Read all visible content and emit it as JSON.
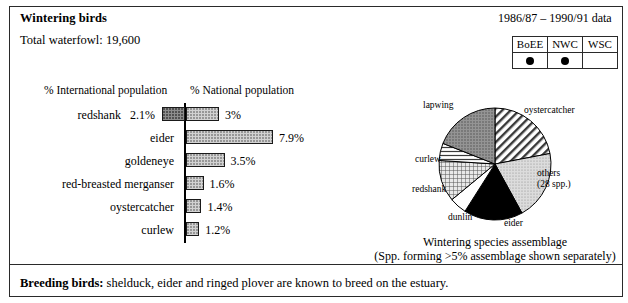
{
  "header": {
    "title": "Wintering birds",
    "total_waterfowl": "Total waterfowl: 19,600",
    "data_period": "1986/87 – 1990/91 data"
  },
  "scheme_table": {
    "columns": [
      "BoEE",
      "NWC",
      "WSC"
    ],
    "marks": [
      "●",
      "●",
      ""
    ]
  },
  "bar_chart": {
    "left_header": "% International population",
    "right_header": "% National population"
  },
  "chart_data": {
    "type": "bar",
    "orientation": "horizontal-diverging",
    "xlabel": "",
    "ylabel": "",
    "categories": [
      "redshank",
      "eider",
      "goldeneye",
      "red-breasted merganser",
      "oystercatcher",
      "curlew"
    ],
    "series": [
      {
        "name": "% International population",
        "side": "left",
        "values": [
          2.1,
          null,
          null,
          null,
          null,
          null
        ],
        "labels": [
          "2.1%",
          "",
          "",
          "",
          "",
          ""
        ]
      },
      {
        "name": "% National population",
        "side": "right",
        "values": [
          3.0,
          7.9,
          3.5,
          1.6,
          1.4,
          1.2
        ],
        "labels": [
          "3%",
          "7.9%",
          "3.5%",
          "1.6%",
          "1.4%",
          "1.2%"
        ]
      }
    ],
    "xlim": [
      0,
      8.5
    ],
    "grid": false,
    "legend": "none"
  },
  "pie_chart": {
    "type": "pie",
    "title": "Wintering species assemblage",
    "caption_line1": "Wintering species assemblage",
    "caption_line2": "(Spp. forming >5% assemblage shown separately)",
    "slices": [
      {
        "label": "oystercatcher",
        "percent": 22,
        "fill": "diagonal-hatch"
      },
      {
        "label": "others\n(28 spp.)",
        "percent": 20,
        "fill": "light-dots"
      },
      {
        "label": "eider",
        "percent": 17,
        "fill": "solid-black"
      },
      {
        "label": "dunlin",
        "percent": 5,
        "fill": "white"
      },
      {
        "label": "redshank",
        "percent": 12,
        "fill": "grid-hatch"
      },
      {
        "label": "curlew",
        "percent": 5,
        "fill": "horizontal-lines"
      },
      {
        "label": "lapwing",
        "percent": 19,
        "fill": "dark-dots"
      }
    ],
    "labels": {
      "oystercatcher": "oystercatcher",
      "others_l1": "others",
      "others_l2": "(28 spp.)",
      "eider": "eider",
      "dunlin": "dunlin",
      "redshank": "redshank",
      "curlew": "curlew",
      "lapwing": "lapwing"
    }
  },
  "footer": {
    "label": "Breeding birds:",
    "text": " shelduck, eider and ringed plover are known to breed on the estuary."
  },
  "colors": {
    "ink": "#000000",
    "border": "#2a2a2a",
    "bar_left_fill": "#8e8e8e",
    "bar_right_fill": "#d2d2d2",
    "pie_black": "#000000",
    "pie_gray": "#8a8a8a"
  }
}
